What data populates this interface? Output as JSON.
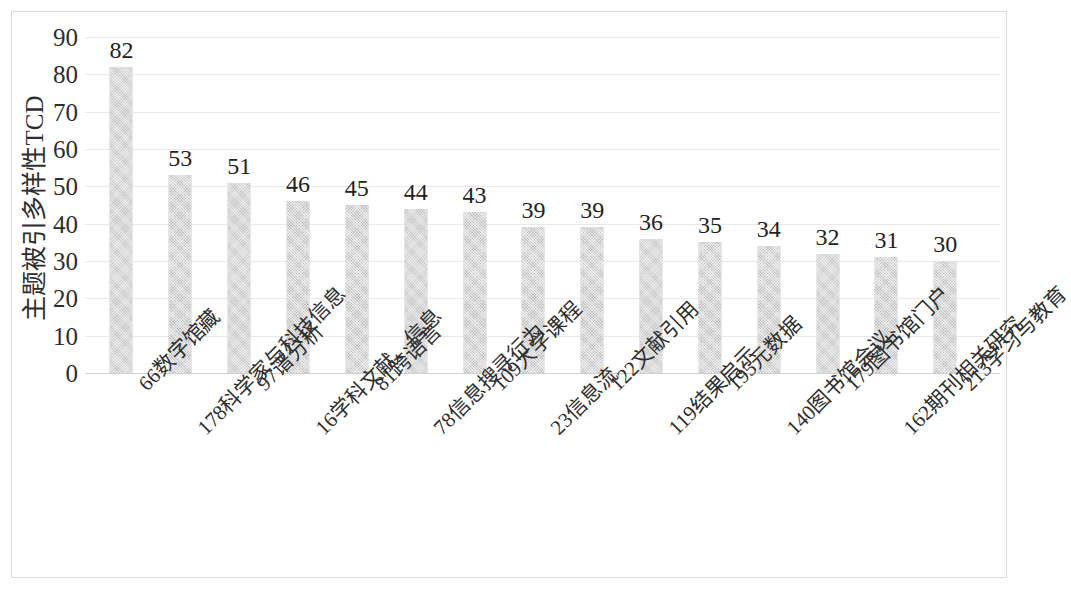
{
  "chart_data": {
    "type": "bar",
    "title": "",
    "xlabel": "",
    "ylabel": "主题被引多样性TCD",
    "ylim": [
      0,
      90
    ],
    "yticks": [
      0,
      10,
      20,
      30,
      40,
      50,
      60,
      70,
      80,
      90
    ],
    "ytick_labels": [
      "0",
      "10",
      "20",
      "30",
      "40",
      "50",
      "60",
      "70",
      "80",
      "90"
    ],
    "grid": true,
    "legend": false,
    "bar_color": "#c2c2c2",
    "categories": [
      "66数字馆藏",
      "178科学家与科技信息",
      "97谱分析",
      "16学科文献、信息",
      "81跨语言",
      "78信息搜寻行为",
      "109大学课程",
      "23信息流",
      "122文献引用",
      "119结果启示",
      "195元数据",
      "140图书馆会议",
      "179图书馆门户",
      "162期刊相关研究",
      "213学习与教育"
    ],
    "values": [
      82,
      53,
      51,
      46,
      45,
      44,
      43,
      39,
      39,
      36,
      35,
      34,
      32,
      31,
      30
    ],
    "value_labels": [
      "82",
      "53",
      "51",
      "46",
      "45",
      "44",
      "43",
      "39",
      "39",
      "36",
      "35",
      "34",
      "32",
      "31",
      "30"
    ]
  }
}
